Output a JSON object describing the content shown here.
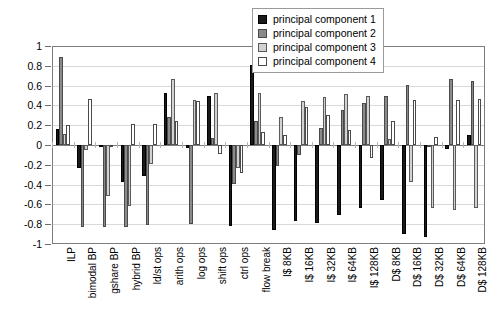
{
  "chart_data": {
    "type": "bar",
    "title": "",
    "subtitle": "",
    "xlabel": "",
    "ylabel": "",
    "ylim": [
      -1,
      1
    ],
    "ytick_labels": [
      "1",
      "0.8",
      "0.6",
      "0.4",
      "0.2",
      "0",
      "-0.2",
      "-0.4",
      "-0.6",
      "-0.8",
      "-1"
    ],
    "ytick_values": [
      1,
      0.8,
      0.6,
      0.4,
      0.2,
      0,
      -0.2,
      -0.4,
      -0.6,
      -0.8,
      -1
    ],
    "grid": true,
    "legend_position": "top-right",
    "categories": [
      "ILP",
      "bimodal BP",
      "gshare BP",
      "hybrid BP",
      "ld/st ops",
      "arith ops",
      "log ops",
      "shift ops",
      "ctrl ops",
      "flow break",
      "I$ 8KB",
      "I$ 16KB",
      "I$ 32KB",
      "I$ 64KB",
      "I$ 128KB",
      "D$ 8KB",
      "D$ 16KB",
      "D$ 32KB",
      "D$ 64KB",
      "D$ 128KB"
    ],
    "series": [
      {
        "name": "principal component 1",
        "color": "#1a1a1a",
        "values": [
          0.16,
          -0.23,
          -0.02,
          -0.37,
          -0.31,
          0.53,
          -0.03,
          0.5,
          -0.82,
          0.81,
          -0.86,
          -0.77,
          -0.79,
          -0.71,
          -0.64,
          -0.56,
          -0.9,
          -0.93,
          -0.04,
          0.1
        ]
      },
      {
        "name": "principal component 2",
        "color": "#8a8a8a",
        "values": [
          0.89,
          -0.83,
          -0.83,
          -0.83,
          -0.81,
          0.28,
          -0.8,
          0.07,
          -0.39,
          0.24,
          -0.21,
          -0.1,
          0.17,
          0.35,
          0.42,
          0.49,
          0.61,
          -0.02,
          0.67,
          0.65
        ]
      },
      {
        "name": "principal component 3",
        "color": "#d2d2d2",
        "values": [
          0.11,
          -0.05,
          -0.52,
          -0.62,
          -0.19,
          0.67,
          0.45,
          0.53,
          -0.23,
          0.53,
          0.28,
          0.44,
          0.48,
          0.52,
          0.49,
          0.06,
          -0.37,
          -0.64,
          -0.66,
          -0.64
        ]
      },
      {
        "name": "principal component 4",
        "color": "#ffffff",
        "values": [
          0.2,
          0.46,
          -0.01,
          0.21,
          0.21,
          0.24,
          0.44,
          -0.09,
          -0.28,
          0.13,
          0.1,
          0.38,
          0.3,
          0.15,
          -0.13,
          0.24,
          0.45,
          0.08,
          0.45,
          0.46
        ]
      }
    ]
  },
  "legend": {
    "items": [
      {
        "label": "principal component 1",
        "key": "pc1"
      },
      {
        "label": "principal component 2",
        "key": "pc2"
      },
      {
        "label": "principal component 3",
        "key": "pc3"
      },
      {
        "label": "principal component 4",
        "key": "pc4"
      }
    ]
  }
}
